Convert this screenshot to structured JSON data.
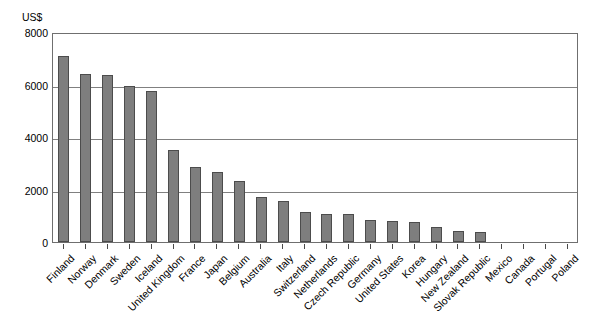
{
  "chart_data": {
    "type": "bar",
    "title": "",
    "xlabel": "",
    "ylabel": "US$",
    "unit_label": "US$",
    "ylim": [
      0,
      8000
    ],
    "ytick_labels": [
      "8000",
      "6000",
      "4000",
      "2000",
      "0"
    ],
    "ytick_values": [
      8000,
      6000,
      4000,
      2000,
      0
    ],
    "grid": "horizontal",
    "legend": "none",
    "bar_color": "#7e7e7e",
    "bar_border_color": "#4c4c4c",
    "gridline_color": "#808080",
    "axis_color": "#6f6f6f",
    "categories": [
      "Finland",
      "Norway",
      "Denmark",
      "Sweden",
      "Iceland",
      "United Kingdom",
      "France",
      "Japan",
      "Belgium",
      "Australia",
      "Italy",
      "Switzerland",
      "Netherlands",
      "Czech Republic",
      "Germany",
      "United States",
      "Korea",
      "Hungary",
      "New Zealand",
      "Slovak Republic",
      "Mexico",
      "Canada",
      "Portugal",
      "Poland"
    ],
    "values": [
      7100,
      6400,
      6350,
      5950,
      5750,
      3500,
      2850,
      2680,
      2320,
      1700,
      1550,
      1150,
      1080,
      1060,
      820,
      800,
      760,
      560,
      420,
      380,
      0,
      0,
      0,
      0
    ]
  }
}
